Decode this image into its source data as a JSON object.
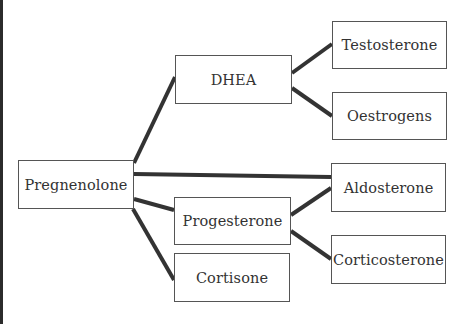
{
  "diagram": {
    "nodes": [
      {
        "id": "pregnenolone",
        "label": "Pregnenolone",
        "x": 18,
        "y": 160,
        "w": 116,
        "h": 49
      },
      {
        "id": "dhea",
        "label": "DHEA",
        "x": 175,
        "y": 55,
        "w": 117,
        "h": 49
      },
      {
        "id": "progesterone",
        "label": "Progesterone",
        "x": 174,
        "y": 197,
        "w": 117,
        "h": 48
      },
      {
        "id": "cortisone",
        "label": "Cortisone",
        "x": 174,
        "y": 253,
        "w": 116,
        "h": 49
      },
      {
        "id": "testosterone",
        "label": "Testosterone",
        "x": 332,
        "y": 21,
        "w": 115,
        "h": 48
      },
      {
        "id": "oestrogens",
        "label": "Oestrogens",
        "x": 332,
        "y": 92,
        "w": 115,
        "h": 48
      },
      {
        "id": "aldosterone",
        "label": "Aldosterone",
        "x": 331,
        "y": 163,
        "w": 115,
        "h": 49
      },
      {
        "id": "corticosterone",
        "label": "Corticosterone",
        "x": 331,
        "y": 235,
        "w": 115,
        "h": 49
      }
    ],
    "edges": [
      {
        "from": "pregnenolone",
        "to": "dhea"
      },
      {
        "from": "pregnenolone",
        "to": "aldosterone"
      },
      {
        "from": "pregnenolone",
        "to": "progesterone"
      },
      {
        "from": "pregnenolone",
        "to": "cortisone"
      },
      {
        "from": "dhea",
        "to": "testosterone"
      },
      {
        "from": "dhea",
        "to": "oestrogens"
      },
      {
        "from": "progesterone",
        "to": "aldosterone"
      },
      {
        "from": "progesterone",
        "to": "corticosterone"
      }
    ],
    "colors": {
      "line": "#333333",
      "border": "#555555",
      "text": "#333333"
    }
  }
}
